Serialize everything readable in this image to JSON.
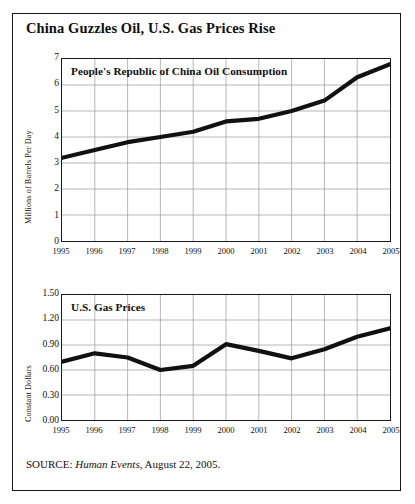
{
  "figure": {
    "title": "China Guzzles Oil, U.S. Gas Prices Rise",
    "source_prefix": "SOURCE:",
    "source_italic": "Human Events",
    "source_suffix": ", August 22, 2005."
  },
  "chart_data": [
    {
      "type": "line",
      "title": "People's Republic of China Oil Consumption",
      "xlabel": "",
      "ylabel": "Millions of Barrels Per Day",
      "categories": [
        "1995",
        "1996",
        "1997",
        "1998",
        "1999",
        "2000",
        "2001",
        "2002",
        "2003",
        "2004",
        "2005"
      ],
      "values": [
        3.2,
        3.5,
        3.8,
        4.0,
        4.2,
        4.6,
        4.7,
        5.0,
        5.4,
        6.3,
        6.8
      ],
      "ylim": [
        0,
        7
      ],
      "yticks": [
        "0",
        "1",
        "2",
        "3",
        "4",
        "5",
        "6",
        "7"
      ],
      "ytick_values": [
        0,
        1,
        2,
        3,
        4,
        5,
        6,
        7
      ],
      "grid": true,
      "legend": "none",
      "line_color": "#111111"
    },
    {
      "type": "line",
      "title": "U.S. Gas Prices",
      "xlabel": "",
      "ylabel": "Constant Dollars",
      "categories": [
        "1995",
        "1996",
        "1997",
        "1998",
        "1999",
        "2000",
        "2001",
        "2002",
        "2003",
        "2004",
        "2005"
      ],
      "values": [
        0.7,
        0.8,
        0.75,
        0.6,
        0.65,
        0.91,
        0.83,
        0.74,
        0.85,
        1.0,
        1.1
      ],
      "ylim": [
        0.0,
        1.5
      ],
      "yticks": [
        "0.00",
        "0.30",
        "0.60",
        "0.90",
        "1.20",
        "1.50"
      ],
      "ytick_values": [
        0.0,
        0.3,
        0.6,
        0.9,
        1.2,
        1.5
      ],
      "grid": true,
      "legend": "none",
      "line_color": "#111111"
    }
  ]
}
